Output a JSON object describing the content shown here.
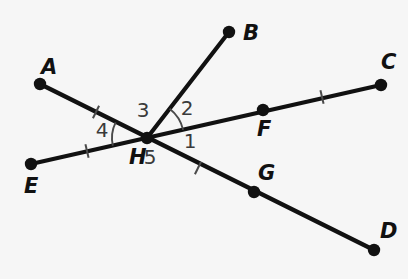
{
  "diagram": {
    "background_color": "#f6f6f6",
    "line_color": "#111111",
    "mark_color": "#4a4a4a",
    "width": 408,
    "height": 279,
    "vertex": {
      "name": "H",
      "x": 147,
      "y": 138
    },
    "points": [
      {
        "id": "A",
        "label": "A",
        "x": 40,
        "y": 84,
        "label_x": 41,
        "label_y": 68,
        "dot": true
      },
      {
        "id": "B",
        "label": "B",
        "x": 229,
        "y": 32,
        "label_x": 243,
        "label_y": 34,
        "dot": true
      },
      {
        "id": "C",
        "label": "C",
        "x": 381,
        "y": 85,
        "label_x": 381,
        "label_y": 63,
        "dot": true
      },
      {
        "id": "D",
        "label": "D",
        "x": 374,
        "y": 250,
        "label_x": 380,
        "label_y": 232,
        "dot": true
      },
      {
        "id": "E",
        "label": "E",
        "x": 31,
        "y": 164,
        "label_x": 24,
        "label_y": 187,
        "dot": true
      },
      {
        "id": "F",
        "label": "F",
        "x": 263,
        "y": 110,
        "label_x": 257,
        "label_y": 130,
        "dot": true
      },
      {
        "id": "G",
        "label": "G",
        "x": 254,
        "y": 192,
        "label_x": 258,
        "label_y": 174,
        "dot": true
      },
      {
        "id": "H",
        "label": "H",
        "x": 147,
        "y": 138,
        "label_x": 129,
        "label_y": 158,
        "dot": true
      }
    ],
    "segments": [
      {
        "id": "A-H-G-D",
        "from": "A",
        "to": "D",
        "x1": 40,
        "y1": 84,
        "x2": 374,
        "y2": 250
      },
      {
        "id": "E-H-F-C",
        "from": "E",
        "to": "C",
        "x1": 31,
        "y1": 164,
        "x2": 381,
        "y2": 85
      },
      {
        "id": "H-B",
        "from": "H",
        "to": "B",
        "x1": 147,
        "y1": 138,
        "x2": 229,
        "y2": 32
      }
    ],
    "tick_marks": [
      {
        "id": "tick-AH",
        "on": "A-H",
        "x": 96,
        "y": 112,
        "angle": 116
      },
      {
        "id": "tick-EH",
        "on": "E-H",
        "x": 87,
        "y": 151,
        "angle": 77
      },
      {
        "id": "tick-HG",
        "on": "H-G",
        "x": 198,
        "y": 168,
        "angle": 116
      },
      {
        "id": "tick-FC",
        "on": "F-C",
        "x": 322,
        "y": 97,
        "angle": 77
      }
    ],
    "angle_labels": [
      {
        "id": "angle-1",
        "label": "1",
        "x": 190,
        "y": 142
      },
      {
        "id": "angle-2",
        "label": "2",
        "x": 187,
        "y": 109
      },
      {
        "id": "angle-3",
        "label": "3",
        "x": 143,
        "y": 111
      },
      {
        "id": "angle-4",
        "label": "4",
        "x": 102,
        "y": 131
      },
      {
        "id": "angle-5",
        "label": "5",
        "x": 150,
        "y": 158
      }
    ],
    "angle_arcs": [
      {
        "id": "arc-2",
        "label_for": "2",
        "radius": 37,
        "start_deg": -52.3,
        "end_deg": -12.7
      },
      {
        "id": "arc-4",
        "label_for": "4",
        "radius": 35,
        "start_deg": 167.3,
        "end_deg": 206.4
      }
    ]
  }
}
